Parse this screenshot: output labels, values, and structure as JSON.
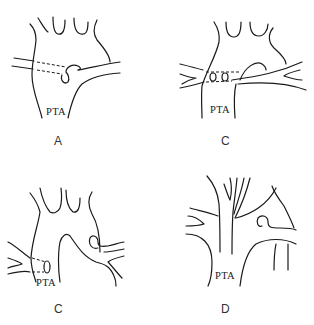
{
  "figure": {
    "panels": [
      {
        "id": "A",
        "label": "A",
        "vessel_label": "PTA"
      },
      {
        "id": "B",
        "label": "B",
        "vessel_label": "PTA"
      },
      {
        "id": "C",
        "label": "C",
        "vessel_label": "PTA"
      },
      {
        "id": "D",
        "label": "D",
        "vessel_label": "PTA"
      }
    ],
    "colors": {
      "line": "#1a1a1a",
      "background": "#ffffff",
      "text": "#222222"
    }
  }
}
